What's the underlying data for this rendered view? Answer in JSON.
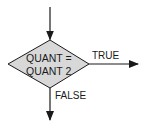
{
  "diagram": {
    "type": "flowchart-decision",
    "colors": {
      "diamond_fill": "#d8d8d8",
      "stroke": "#1a1a1a",
      "background": "#ffffff"
    },
    "decision": {
      "line1": "QUANT =",
      "line2": "QUANT 2"
    },
    "branches": {
      "true_label": "TRUE",
      "false_label": "FALSE"
    }
  }
}
